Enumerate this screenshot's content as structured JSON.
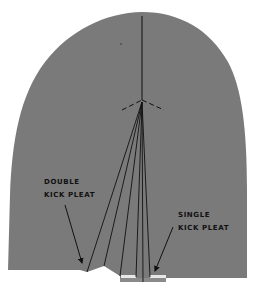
{
  "diagram": {
    "colors": {
      "fabric": "#7a7a7a",
      "lines": "#111111",
      "pleat_underlay": "#e8e8e8",
      "background": "#ffffff"
    },
    "labels": {
      "double_kick_pleat": {
        "line1": "DOUBLE",
        "line2": "KICK PLEAT"
      },
      "single_kick_pleat": {
        "line1": "SINGLE",
        "line2": "KICK PLEAT"
      }
    }
  }
}
